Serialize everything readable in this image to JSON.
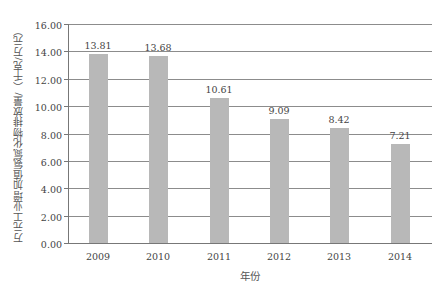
{
  "chart_data": {
    "type": "bar",
    "title": "",
    "xlabel": "年份",
    "ylabel": "万元工业增加值氨氮化物排放量/（千克/万元）",
    "categories": [
      "2009",
      "2010",
      "2011",
      "2012",
      "2013",
      "2014"
    ],
    "values": [
      13.81,
      13.68,
      10.61,
      9.09,
      8.42,
      7.21
    ],
    "value_labels": [
      "13.81",
      "13.68",
      "10.61",
      "9.09",
      "8.42",
      "7.21"
    ],
    "ylim": [
      0,
      16
    ],
    "yticks": [
      "0.00",
      "2.00",
      "4.00",
      "6.00",
      "8.00",
      "10.00",
      "12.00",
      "14.00",
      "16.00"
    ],
    "ytick_values": [
      0,
      2,
      4,
      6,
      8,
      10,
      12,
      14,
      16
    ],
    "grid": true,
    "legend": null,
    "colors": {
      "bar": "#b8b8b8",
      "grid": "#8c8c8c",
      "axis": "#777777"
    }
  },
  "geometry": {
    "plot_left": 68,
    "plot_right": 432,
    "y_zero_px": 243,
    "y_top_px": 24,
    "bar_width": 19,
    "bar_centers": [
      98,
      158,
      219,
      279,
      339,
      400
    ]
  }
}
